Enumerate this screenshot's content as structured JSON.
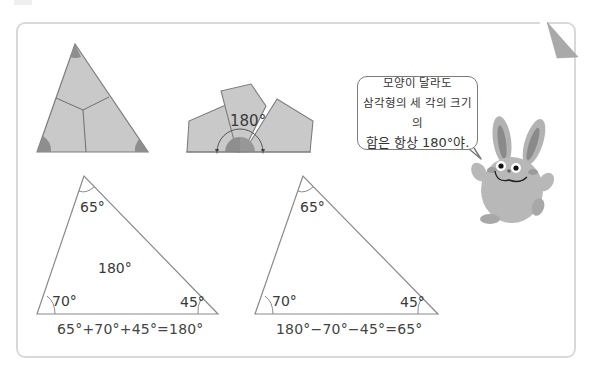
{
  "diagrams": {
    "torn_triangle": {
      "description": "triangle divided into three pieces with shaded corners"
    },
    "assembled_angles": {
      "label": "180°"
    }
  },
  "speech_bubble": {
    "line1": "모양이 달라도",
    "line2": "삼각형의 세 각의 크기의",
    "line3_prefix": "합은 항상 ",
    "line3_value": "180°",
    "line3_suffix": "야."
  },
  "triangle_left": {
    "angle_top": "65°",
    "angle_left": "70°",
    "angle_right": "45°",
    "center_label": "180°",
    "equation": "65°+70°+45°=180°"
  },
  "triangle_right": {
    "angle_top": "65°",
    "angle_left": "70°",
    "angle_right": "45°",
    "equation": "180°−70°−45°=65°"
  },
  "colors": {
    "shape_fill": "#c8c8c8",
    "shape_stroke": "#7d7d7d",
    "corner_shade": "#8e8e8e",
    "card_border": "#d9d9d9",
    "line": "#8a8a8a"
  }
}
